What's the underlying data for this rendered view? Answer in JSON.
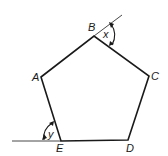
{
  "diagram": {
    "type": "pentagon-exterior-angles",
    "vertices": [
      {
        "label": "A",
        "x": 41,
        "y": 77,
        "label_x": 32,
        "label_y": 81
      },
      {
        "label": "B",
        "x": 94,
        "y": 36,
        "label_x": 88,
        "label_y": 31
      },
      {
        "label": "C",
        "x": 149,
        "y": 76,
        "label_x": 151,
        "label_y": 80
      },
      {
        "label": "D",
        "x": 128,
        "y": 140,
        "label_x": 126,
        "label_y": 152
      },
      {
        "label": "E",
        "x": 61,
        "y": 141,
        "label_x": 56,
        "label_y": 152
      }
    ],
    "angles": [
      {
        "label": "x",
        "at": "B",
        "label_x": 103,
        "label_y": 38
      },
      {
        "label": "y",
        "at": "E",
        "label_x": 48,
        "label_y": 138
      }
    ],
    "extension_lines": [
      {
        "name": "AB-extended",
        "x1": 94,
        "y1": 36,
        "x2": 122,
        "y2": 15
      },
      {
        "name": "DE-extended",
        "x1": 61,
        "y1": 141,
        "x2": 12,
        "y2": 141
      }
    ],
    "colors": {
      "stroke": "#1a1a1a",
      "background": "#ffffff"
    }
  }
}
